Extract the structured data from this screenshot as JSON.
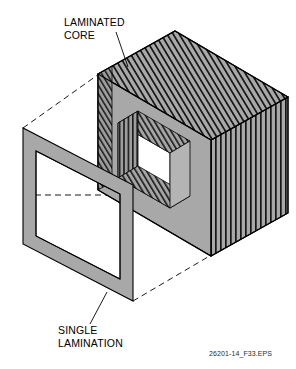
{
  "figure": {
    "id_label": "26201-14_F33.EPS",
    "background_color": "#ffffff",
    "line_color": "#000000",
    "face_gray": "#a0a0a0",
    "face_gray_dark": "#8c8c8c",
    "face_gray_light": "#b0b0b0",
    "hatch_color": "#1a1a1a"
  },
  "callouts": [
    {
      "key": "laminated-core",
      "line1": "LAMINATED",
      "line2": "CORE",
      "text_x": 64,
      "text_y": 26,
      "leader_from_x": 116,
      "leader_from_y": 32,
      "leader_to_x": 128,
      "leader_to_y": 67
    },
    {
      "key": "single-lamination",
      "line1": "SINGLE",
      "line2": "LAMINATION",
      "text_x": 58,
      "text_y": 334,
      "leader_from_x": 107,
      "leader_from_y": 292,
      "leader_to_x": 90,
      "leader_to_y": 324
    }
  ],
  "core": {
    "name": "laminated-core",
    "top_face_hatch_count": 34,
    "right_face_hatch_count": 24,
    "window_hatch_count": 20,
    "description": "Rectangular isometric core block with window opening, laminations shown as fine parallel lines on all exposed faces"
  },
  "lamination": {
    "name": "single-lamination",
    "description": "Flat rectangular frame shown exploded to the left of the core, same outline shape as one core lamination"
  },
  "projection_lines": {
    "name": "dashed-projection-lines",
    "count": 3,
    "description": "Dashed lines linking single lamination corners to corresponding core corners"
  }
}
